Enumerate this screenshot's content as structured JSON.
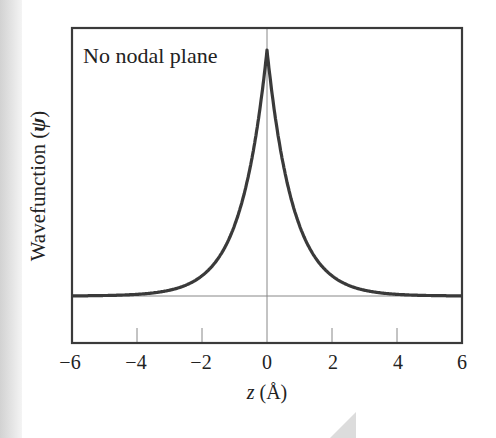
{
  "chart_data": {
    "type": "line",
    "title": "No nodal plane",
    "xlabel": "z (Å)",
    "ylabel": "Wavefunction (ψ)",
    "xlim": [
      -6,
      6
    ],
    "ylim": [
      0,
      1
    ],
    "xticks": [
      "−6",
      "−4",
      "−2",
      "0",
      "2",
      "4",
      "6"
    ],
    "yticks": [],
    "grid": false,
    "legend": null,
    "series": [
      {
        "name": "ψ(z)",
        "description": "Cusp-shaped exponential decay, ψ ≈ exp(-1.25|z|), no sign change",
        "x": [
          -6,
          -5,
          -4,
          -3,
          -2,
          -1.5,
          -1,
          -0.5,
          -0.25,
          0,
          0.25,
          0.5,
          1,
          1.5,
          2,
          3,
          4,
          5,
          6
        ],
        "y": [
          0.0,
          0.002,
          0.007,
          0.024,
          0.082,
          0.153,
          0.287,
          0.535,
          0.732,
          1.0,
          0.732,
          0.535,
          0.287,
          0.153,
          0.082,
          0.024,
          0.007,
          0.002,
          0.0
        ]
      }
    ],
    "reference_lines": {
      "horizontal_y": 0,
      "vertical_x": 0
    },
    "colors": {
      "curve": "#3a3a3a",
      "axes": "#333333",
      "reference": "#777777"
    }
  },
  "labels": {
    "title": "No nodal plane",
    "ylabel_text": "Wavefunction (",
    "ylabel_symbol": "ψ",
    "ylabel_close": ")",
    "xlabel_var": "z",
    "xlabel_unit": " (Å)",
    "ticks": [
      "−6",
      "−4",
      "−2",
      "0",
      "2",
      "4",
      "6"
    ]
  }
}
